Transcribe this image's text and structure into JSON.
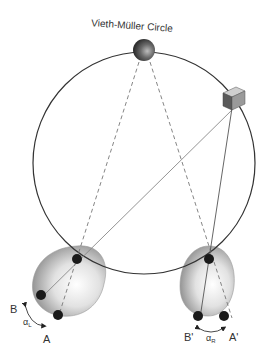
{
  "title": "Vieth-Müller Circle",
  "labels": {
    "left_b": "B",
    "left_a": "A",
    "left_alpha": "α",
    "left_alpha_sub": "L",
    "right_b": "B'",
    "right_a": "A'",
    "right_alpha": "α",
    "right_alpha_sub": "R"
  },
  "objects": {
    "fixation_target": "sphere",
    "peripheral_target": "cube"
  },
  "colors": {
    "stroke": "#333333",
    "dashed": "#777777",
    "eye_fill": "#cfcfcf",
    "dot": "#1a1a1a"
  }
}
